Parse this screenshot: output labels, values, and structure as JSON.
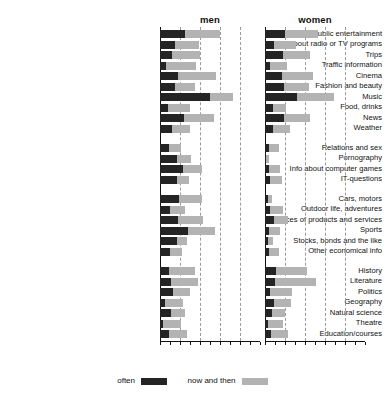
{
  "panels": [
    {
      "key": "men",
      "title": "men"
    },
    {
      "key": "women",
      "title": "women"
    }
  ],
  "legend": {
    "position": "bottom",
    "items": [
      {
        "label": "often",
        "color": "#242424"
      },
      {
        "label": "now and then",
        "color": "#b3b3b3"
      }
    ]
  },
  "colors": {
    "often": "#242424",
    "now_and_then": "#b3b3b3",
    "axis": "#111111",
    "gridline": "#9a9a9a",
    "background": "#ffffff"
  },
  "axis": {
    "xmin": 0,
    "xmax": 100,
    "gridlines": [
      20,
      40,
      60,
      80,
      100
    ],
    "grid": true,
    "tick_labels_shown": false
  },
  "groups": [
    {
      "name": "entertainment",
      "categories": [
        "Public entertainment",
        "Info about radio or TV programs",
        "Trips",
        "Traffic information",
        "Cinema",
        "Fashion and beauty",
        "Music",
        "Food, drinks",
        "News",
        "Weather"
      ]
    },
    {
      "name": "relations-and-computers",
      "categories": [
        "Relations and sex",
        "Pornography",
        "Info about computer games",
        "IT-questions"
      ]
    },
    {
      "name": "economical",
      "categories": [
        "Cars, motors",
        "Outdoor life, adventures",
        "Prices of products and services",
        "Sports",
        "Stocks, bonds and the like",
        "Other economical info"
      ]
    },
    {
      "name": "knowledge-culture",
      "categories": [
        "History",
        "Literature",
        "Politics",
        "Geography",
        "Natural science",
        "Theatre",
        "Education/courses"
      ]
    }
  ],
  "chart_data": {
    "type": "bar",
    "orientation": "horizontal",
    "stacked": true,
    "title": "",
    "subtitle": "",
    "xlabel": "",
    "ylabel": "",
    "xlim": [
      0,
      100
    ],
    "grid": true,
    "legend_position": "bottom",
    "panel_names": [
      "men",
      "women"
    ],
    "series_names": [
      "often",
      "now and then"
    ],
    "categories": [
      "Public entertainment",
      "Info about radio or TV programs",
      "Trips",
      "Traffic information",
      "Cinema",
      "Fashion and beauty",
      "Music",
      "Food, drinks",
      "News",
      "Weather",
      "Relations and sex",
      "Pornography",
      "Info about computer games",
      "IT-questions",
      "Cars, motors",
      "Outdoor life, adventures",
      "Prices of products and services",
      "Sports",
      "Stocks, bonds and the like",
      "Other economical info",
      "History",
      "Literature",
      "Politics",
      "Geography",
      "Natural science",
      "Theatre",
      "Education/courses"
    ],
    "men": {
      "often": [
        25,
        15,
        12,
        6,
        18,
        15,
        50,
        8,
        24,
        12,
        9,
        17,
        23,
        17,
        19,
        10,
        18,
        28,
        17,
        10,
        9,
        11,
        13,
        5,
        11,
        3,
        9
      ],
      "now_and_then": [
        35,
        24,
        28,
        30,
        38,
        20,
        23,
        22,
        30,
        18,
        12,
        14,
        19,
        12,
        23,
        15,
        25,
        27,
        10,
        12,
        26,
        27,
        17,
        18,
        14,
        18,
        18
      ]
    },
    "women": {
      "often": [
        20,
        9,
        18,
        5,
        17,
        19,
        32,
        8,
        19,
        8,
        4,
        1,
        4,
        5,
        3,
        5,
        9,
        4,
        3,
        4,
        11,
        10,
        5,
        9,
        7,
        3,
        6
      ],
      "now_and_then": [
        33,
        22,
        27,
        17,
        31,
        25,
        37,
        13,
        26,
        17,
        10,
        3,
        11,
        12,
        4,
        13,
        14,
        11,
        5,
        10,
        31,
        41,
        22,
        17,
        13,
        15,
        17
      ]
    }
  }
}
